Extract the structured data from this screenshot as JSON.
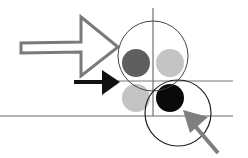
{
  "diagram": {
    "title": "",
    "colors": {
      "background": "#ffffff",
      "outline_arrow": "#7a7a7a",
      "black_arrow": "#111111",
      "gray_arrow": "#7f7f7f",
      "line": "#555555",
      "circle_outline": "#333333",
      "dot_dark_gray": "#5f5f5f",
      "dot_light_gray": "#c4c4c4",
      "dot_black": "#0a0a0a"
    },
    "elements": [
      {
        "type": "outline-arrow",
        "direction": "right"
      },
      {
        "type": "solid-arrow",
        "color": "black",
        "direction": "right"
      },
      {
        "type": "solid-arrow",
        "color": "gray",
        "direction": "up-left"
      },
      {
        "type": "circle-outline",
        "size": "large"
      },
      {
        "type": "circle-outline",
        "size": "small"
      },
      {
        "type": "dot",
        "color": "dark-gray"
      },
      {
        "type": "dot",
        "color": "light-gray",
        "position": "upper-right"
      },
      {
        "type": "dot",
        "color": "light-gray",
        "position": "lower-left"
      },
      {
        "type": "dot",
        "color": "black"
      }
    ]
  }
}
